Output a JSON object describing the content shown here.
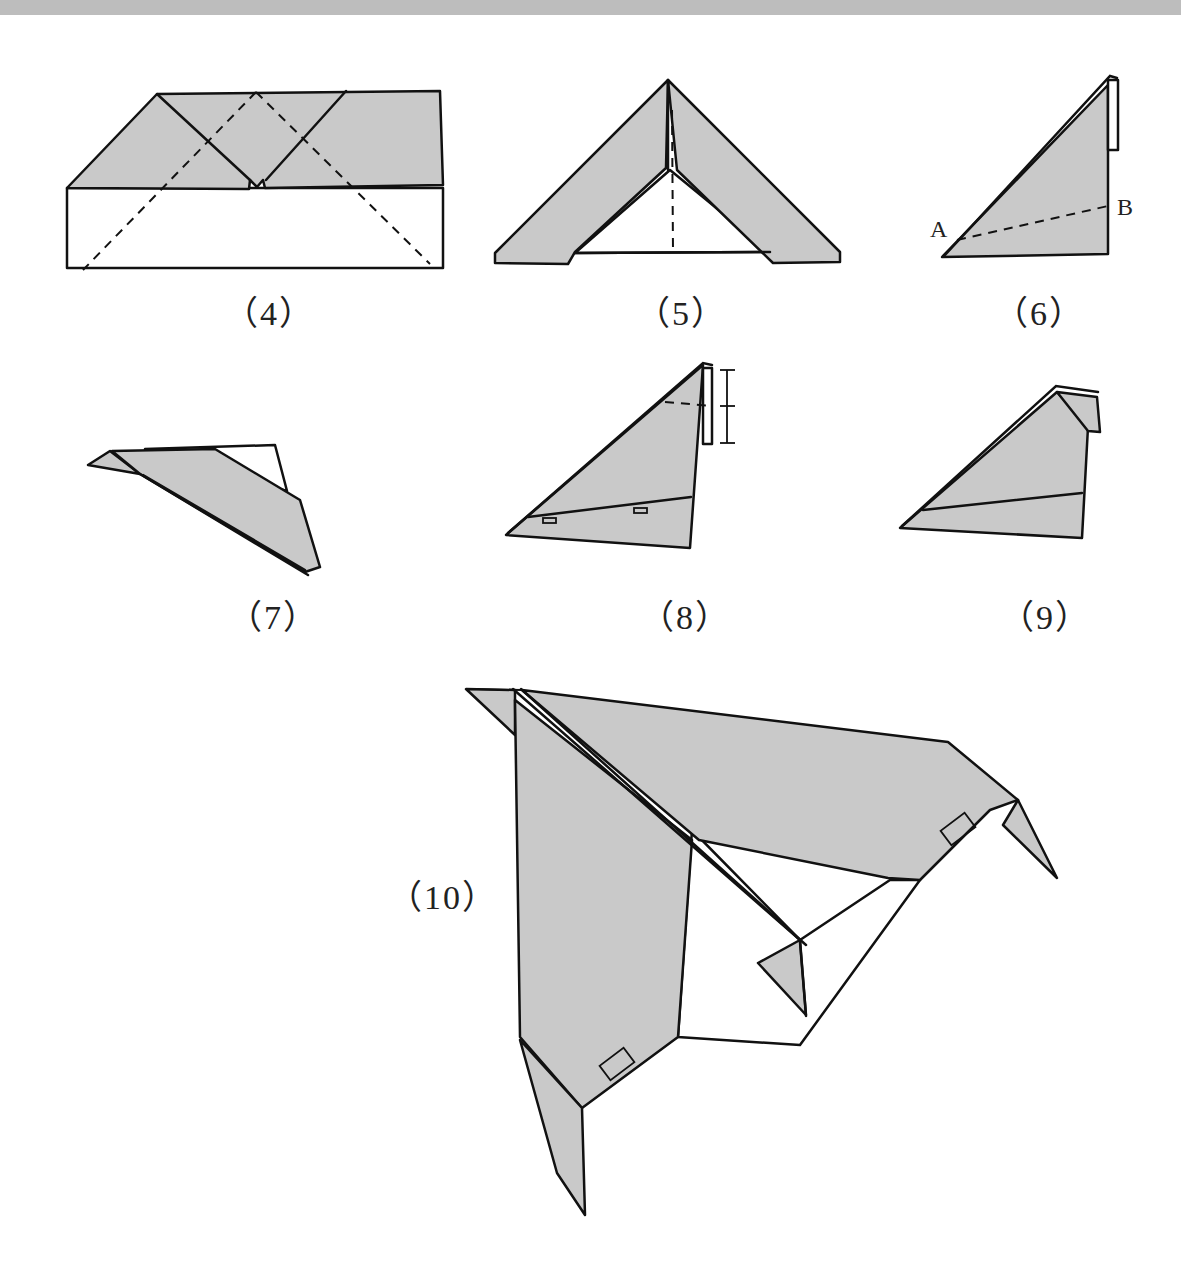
{
  "page": {
    "background": "#ffffff",
    "top_band_color": "#bdbdbd",
    "paper_fill": "#c9c9c9",
    "line_color": "#111111"
  },
  "steps": [
    {
      "id": "4",
      "label": "（4）"
    },
    {
      "id": "5",
      "label": "（5）"
    },
    {
      "id": "6",
      "label": "（6）",
      "points": [
        {
          "name": "A"
        },
        {
          "name": "B"
        }
      ]
    },
    {
      "id": "7",
      "label": "（7）"
    },
    {
      "id": "8",
      "label": "（8）"
    },
    {
      "id": "9",
      "label": "（9）"
    },
    {
      "id": "10",
      "label": "（10）"
    }
  ]
}
